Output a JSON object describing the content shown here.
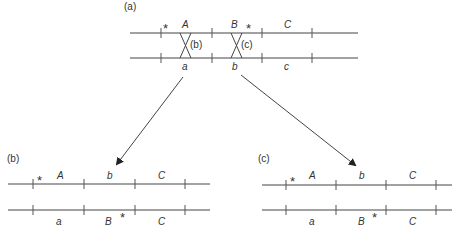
{
  "panels": {
    "a": {
      "label": "(a)",
      "chromosome_top": {
        "alleles": [
          "A",
          "B",
          "C"
        ],
        "marker": "*"
      },
      "chromosome_bottom": {
        "alleles": [
          "a",
          "b",
          "c"
        ]
      },
      "crossovers": [
        "(b)",
        "(c)"
      ]
    },
    "b": {
      "label": "(b)",
      "chromosome_top": {
        "alleles": [
          "A",
          "b",
          "C"
        ],
        "marker": "*"
      },
      "chromosome_bottom": {
        "alleles": [
          "a",
          "B",
          "C"
        ],
        "marker": "*"
      }
    },
    "c": {
      "label": "(c)",
      "chromosome_top": {
        "alleles": [
          "A",
          "b",
          "C"
        ],
        "marker": "*"
      },
      "chromosome_bottom": {
        "alleles": [
          "a",
          "B",
          "C"
        ],
        "marker": "*"
      }
    }
  },
  "colors": {
    "line": "#444444",
    "text": "#333333"
  }
}
